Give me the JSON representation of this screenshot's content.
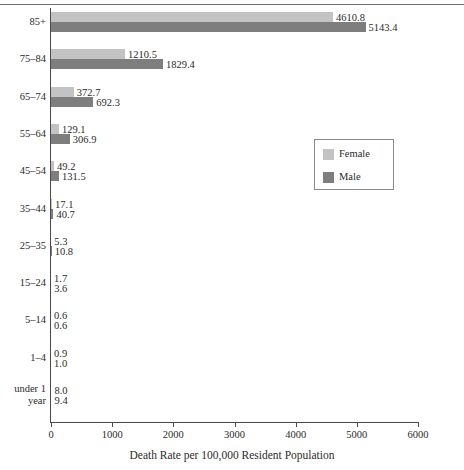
{
  "chart_data": {
    "type": "bar",
    "orientation": "horizontal",
    "title": "",
    "xlabel": "Death Rate per 100,000 Resident Population",
    "ylabel": "",
    "xlim": [
      0,
      6000
    ],
    "xticks": [
      0,
      1000,
      2000,
      3000,
      4000,
      5000,
      6000
    ],
    "xtick_labels": [
      "0",
      "1000",
      "2000",
      "3000",
      "4000",
      "5000",
      "6000"
    ],
    "grid": false,
    "legend_position": "center-right",
    "categories": [
      "85+",
      "75–84",
      "65–74",
      "55–64",
      "45–54",
      "35–44",
      "25–35",
      "15–24",
      "5–14",
      "1–4",
      "under 1 year"
    ],
    "category_lines": [
      [
        "85+"
      ],
      [
        "75–84"
      ],
      [
        "65–74"
      ],
      [
        "55–64"
      ],
      [
        "45–54"
      ],
      [
        "35–44"
      ],
      [
        "25–35"
      ],
      [
        "15–24"
      ],
      [
        "5–14"
      ],
      [
        "1–4"
      ],
      [
        "under 1",
        "year"
      ]
    ],
    "series": [
      {
        "name": "Female",
        "color": "#c3c3c3",
        "values": [
          4610.8,
          1210.5,
          372.7,
          129.1,
          49.2,
          17.1,
          5.3,
          1.7,
          0.6,
          0.9,
          8.0
        ],
        "labels": [
          "4610.8",
          "1210.5",
          "372.7",
          "129.1",
          "49.2",
          "17.1",
          "5.3",
          "1.7",
          "0.6",
          "0.9",
          "8.0"
        ]
      },
      {
        "name": "Male",
        "color": "#7e7e7e",
        "values": [
          5143.4,
          1829.4,
          692.3,
          306.9,
          131.5,
          40.7,
          10.8,
          3.6,
          0.6,
          1.0,
          9.4
        ],
        "labels": [
          "5143.4",
          "1829.4",
          "692.3",
          "306.9",
          "131.5",
          "40.7",
          "10.8",
          "3.6",
          "0.6",
          "1.0",
          "9.4"
        ]
      }
    ]
  },
  "legend": {
    "entries": [
      {
        "label": "Female",
        "color": "#c3c3c3"
      },
      {
        "label": "Male",
        "color": "#7e7e7e"
      }
    ]
  }
}
